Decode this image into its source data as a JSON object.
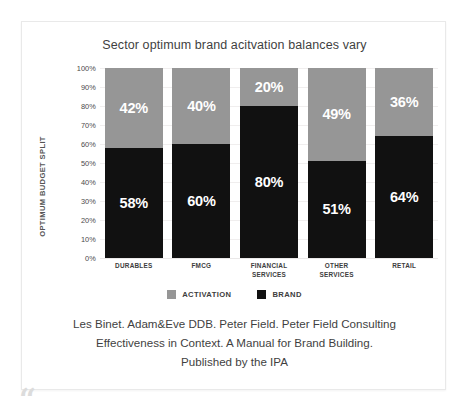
{
  "chart_data": {
    "type": "bar",
    "subtype": "stacked-100",
    "title": "Sector optimum brand acitvation balances vary",
    "xlabel": "",
    "ylabel": "OPTIMUM BUDGET SPLIT",
    "ylim": [
      0,
      100
    ],
    "grid": true,
    "legend_position": "bottom",
    "categories": [
      "DURABLES",
      "FMCG",
      "FINANCIAL SERVICES",
      "OTHER SERVICES",
      "RETAIL"
    ],
    "category_lines": [
      [
        "DURABLES"
      ],
      [
        "FMCG"
      ],
      [
        "FINANCIAL",
        "SERVICES"
      ],
      [
        "OTHER",
        "SERVICES"
      ],
      [
        "RETAIL"
      ]
    ],
    "ticks": [
      "100%",
      "90%",
      "80%",
      "70%",
      "60%",
      "50%",
      "40%",
      "30%",
      "20%",
      "10%",
      "0%"
    ],
    "tick_values": [
      100,
      90,
      80,
      70,
      60,
      50,
      40,
      30,
      20,
      10,
      0
    ],
    "series": [
      {
        "name": "ACTIVATION",
        "color": "#969696",
        "values": [
          42,
          40,
          20,
          49,
          36
        ],
        "labels": [
          "42%",
          "40%",
          "20%",
          "49%",
          "36%"
        ]
      },
      {
        "name": "BRAND",
        "color": "#111111",
        "values": [
          58,
          60,
          80,
          51,
          64
        ],
        "labels": [
          "58%",
          "60%",
          "80%",
          "51%",
          "64%"
        ]
      }
    ]
  },
  "legend": {
    "items": [
      {
        "label": "ACTIVATION",
        "color": "#969696"
      },
      {
        "label": "BRAND",
        "color": "#111111"
      }
    ]
  },
  "caption": {
    "line1": "Les Binet. Adam&Eve DDB. Peter Field. Peter Field Consulting",
    "line2": "Effectiveness in Context. A Manual for Brand Building.",
    "line3": "Published by the IPA"
  },
  "decoration": {
    "quote_glyph": "“"
  }
}
